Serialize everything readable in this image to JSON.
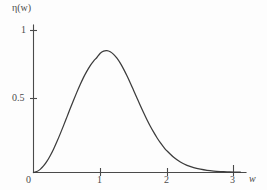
{
  "figure": {
    "background_color": "#fdfdfd",
    "ink_color": "#3c3c3c",
    "axis_color": "#4a4a4a"
  },
  "labels": {
    "y_axis_title": "η(w)",
    "x_axis_title": "w",
    "y_tick_1": "1",
    "y_tick_05": "0.5",
    "x_tick_0": "0",
    "x_tick_1": "1",
    "x_tick_2": "2",
    "x_tick_3": "3"
  },
  "chart_data": {
    "type": "line",
    "title": "",
    "xlabel": "w",
    "ylabel": "η(w)",
    "xlim": [
      0,
      3.2
    ],
    "ylim": [
      0,
      1.05
    ],
    "xticks": [
      0,
      1,
      2,
      3
    ],
    "xticklabels": [
      "0",
      "1",
      "2",
      "3"
    ],
    "yticks": [
      0.5,
      1
    ],
    "yticklabels": [
      "0.5",
      "1"
    ],
    "grid": false,
    "legend": null,
    "series": [
      {
        "name": "η(w)",
        "color": "#3c3c3c",
        "linewidth": 1.25,
        "x": [
          0.0,
          0.05,
          0.1,
          0.15,
          0.2,
          0.25,
          0.3,
          0.35,
          0.4,
          0.45,
          0.5,
          0.55,
          0.6,
          0.65,
          0.7,
          0.75,
          0.8,
          0.85,
          0.9,
          0.95,
          1.0,
          1.05,
          1.1,
          1.15,
          1.2,
          1.25,
          1.3,
          1.35,
          1.4,
          1.45,
          1.5,
          1.55,
          1.6,
          1.65,
          1.7,
          1.75,
          1.8,
          1.85,
          1.9,
          1.95,
          2.0,
          2.1,
          2.2,
          2.3,
          2.4,
          2.5,
          2.6,
          2.7,
          2.8,
          2.9,
          3.0,
          3.1
        ],
        "y": [
          0.0,
          0.007,
          0.022,
          0.046,
          0.078,
          0.118,
          0.164,
          0.216,
          0.272,
          0.33,
          0.39,
          0.45,
          0.509,
          0.566,
          0.62,
          0.67,
          0.714,
          0.753,
          0.785,
          0.81,
          0.84,
          0.855,
          0.858,
          0.85,
          0.832,
          0.805,
          0.77,
          0.728,
          0.681,
          0.631,
          0.578,
          0.525,
          0.472,
          0.421,
          0.372,
          0.326,
          0.284,
          0.245,
          0.21,
          0.179,
          0.152,
          0.107,
          0.074,
          0.05,
          0.034,
          0.023,
          0.015,
          0.01,
          0.007,
          0.005,
          0.003,
          0.002
        ]
      }
    ],
    "annotations": [],
    "peak": {
      "x": 1.1,
      "y": 0.86
    }
  }
}
